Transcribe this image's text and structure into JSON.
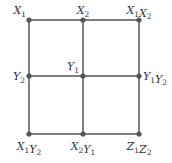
{
  "colors": {
    "line": "#555555",
    "node": "#555555",
    "label": "#333333",
    "background": "#ffffff"
  },
  "grid": {
    "xs": [
      29,
      83,
      139
    ],
    "ys": [
      20,
      76,
      134
    ]
  },
  "nodes": [
    {
      "id": "n00",
      "col": 0,
      "row": 0,
      "label": [
        {
          "v": "X",
          "s": "1"
        }
      ],
      "anchor": "above-left"
    },
    {
      "id": "n10",
      "col": 1,
      "row": 0,
      "label": [
        {
          "v": "X",
          "s": "2"
        }
      ],
      "anchor": "above"
    },
    {
      "id": "n20",
      "col": 2,
      "row": 0,
      "label": [
        {
          "v": "X",
          "s": "1"
        },
        {
          "v": "X",
          "s": "2"
        }
      ],
      "anchor": "above"
    },
    {
      "id": "n01",
      "col": 0,
      "row": 1,
      "label": [
        {
          "v": "Y",
          "s": "2"
        }
      ],
      "anchor": "left"
    },
    {
      "id": "n11",
      "col": 1,
      "row": 1,
      "label": [
        {
          "v": "Y",
          "s": "1"
        }
      ],
      "anchor": "above-left"
    },
    {
      "id": "n21",
      "col": 2,
      "row": 1,
      "label": [
        {
          "v": "Y",
          "s": "1"
        },
        {
          "v": "Y",
          "s": "2"
        }
      ],
      "anchor": "right"
    },
    {
      "id": "n02",
      "col": 0,
      "row": 2,
      "label": [
        {
          "v": "X",
          "s": "1"
        },
        {
          "v": "Y",
          "s": "2"
        }
      ],
      "anchor": "below"
    },
    {
      "id": "n12",
      "col": 1,
      "row": 2,
      "label": [
        {
          "v": "X",
          "s": "2"
        },
        {
          "v": "Y",
          "s": "1"
        }
      ],
      "anchor": "below"
    },
    {
      "id": "n22",
      "col": 2,
      "row": 2,
      "label": [
        {
          "v": "Z",
          "s": "1"
        },
        {
          "v": "Z",
          "s": "2"
        }
      ],
      "anchor": "below"
    }
  ],
  "label_text": {
    "n00": "X1",
    "n10": "X2",
    "n20": "X1X2",
    "n01": "Y2",
    "n11": "Y1",
    "n21": "Y1Y2",
    "n02": "X1Y2",
    "n12": "X2Y1",
    "n22": "Z1Z2"
  }
}
